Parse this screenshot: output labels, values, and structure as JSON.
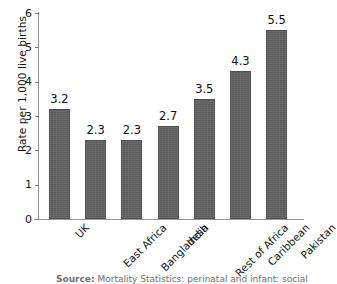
{
  "chart_data": {
    "type": "bar",
    "title": "",
    "subtitle": "",
    "xlabel": "",
    "ylabel": "Rate per 1,000 live births",
    "ylim": [
      0,
      6
    ],
    "yticks": [
      0,
      1,
      2,
      3,
      4,
      5,
      6
    ],
    "ytick_labels": [
      "0",
      "1",
      "2",
      "3",
      "4",
      "5",
      "6"
    ],
    "grid": false,
    "legend": false,
    "legend_position": "none",
    "bar_color": "#616161",
    "categories": [
      "UK",
      "East Africa",
      "Bangladesh",
      "India",
      "Rest of  Africa",
      "Caribbean",
      "Pakistan"
    ],
    "values": [
      3.2,
      2.3,
      2.3,
      2.7,
      3.5,
      4.3,
      5.5
    ],
    "value_labels": [
      "3.2",
      "2.3",
      "2.3",
      "2.7",
      "3.5",
      "4.3",
      "5.5"
    ]
  },
  "caption": {
    "source_prefix": "Source:",
    "source_text": "Mortality Statistics: perinatal and infant: social"
  }
}
